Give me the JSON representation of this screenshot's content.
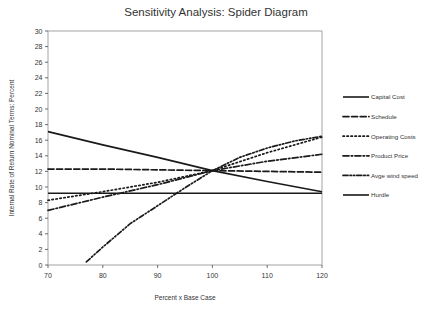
{
  "chart_data": {
    "type": "line",
    "title": "Sensitivity Analysis: Spider Diagram",
    "xlabel": "Percent x Base Case",
    "ylabel": "Internal Rate of Return Nominal Terms: Percent",
    "xlim": [
      70,
      120
    ],
    "ylim": [
      0,
      30
    ],
    "xticks": [
      70,
      80,
      90,
      100,
      110,
      120
    ],
    "yticks": [
      0,
      2,
      4,
      6,
      8,
      10,
      12,
      14,
      16,
      18,
      20,
      22,
      24,
      26,
      28,
      30
    ],
    "grid": false,
    "legend_position": "right",
    "line_color": "#1a1a1a",
    "series": [
      {
        "name": "Capital Cost",
        "style": "solid",
        "x": [
          70,
          80,
          90,
          100,
          110,
          120
        ],
        "values": [
          17.1,
          15.4,
          13.8,
          12.1,
          10.7,
          9.4
        ]
      },
      {
        "name": "Schedule",
        "style": "dashed",
        "x": [
          70,
          80,
          90,
          100,
          110,
          120
        ],
        "values": [
          12.3,
          12.3,
          12.2,
          12.1,
          12.0,
          11.9
        ]
      },
      {
        "name": "Operating Costs",
        "style": "dotted",
        "x": [
          70,
          80,
          90,
          100,
          110,
          120
        ],
        "values": [
          8.3,
          9.4,
          10.6,
          12.1,
          14.4,
          16.4
        ]
      },
      {
        "name": "Product Price",
        "style": "dash-dot",
        "x": [
          70,
          80,
          90,
          100,
          110,
          120
        ],
        "values": [
          7.0,
          8.7,
          10.3,
          12.1,
          13.3,
          14.2
        ]
      },
      {
        "name": "Avge wind speed",
        "style": "dash-dot-dot",
        "x": [
          77,
          80,
          85,
          90,
          95,
          100,
          105,
          110,
          115,
          120
        ],
        "values": [
          0.4,
          2.3,
          5.3,
          7.6,
          9.9,
          12.1,
          13.8,
          15.0,
          15.9,
          16.5
        ]
      },
      {
        "name": "Hurdle",
        "style": "solid",
        "x": [
          70,
          120
        ],
        "values": [
          9.2,
          9.2
        ]
      }
    ]
  },
  "legend": {
    "items": [
      {
        "label": "Capital Cost",
        "style": "solid"
      },
      {
        "label": "Schedule",
        "style": "dashed"
      },
      {
        "label": "Operating Costs",
        "style": "dotted"
      },
      {
        "label": "Product Price",
        "style": "dash-dot"
      },
      {
        "label": "Avge wind speed",
        "style": "dash-dot-dot"
      },
      {
        "label": "Hurdle",
        "style": "solid"
      }
    ]
  }
}
